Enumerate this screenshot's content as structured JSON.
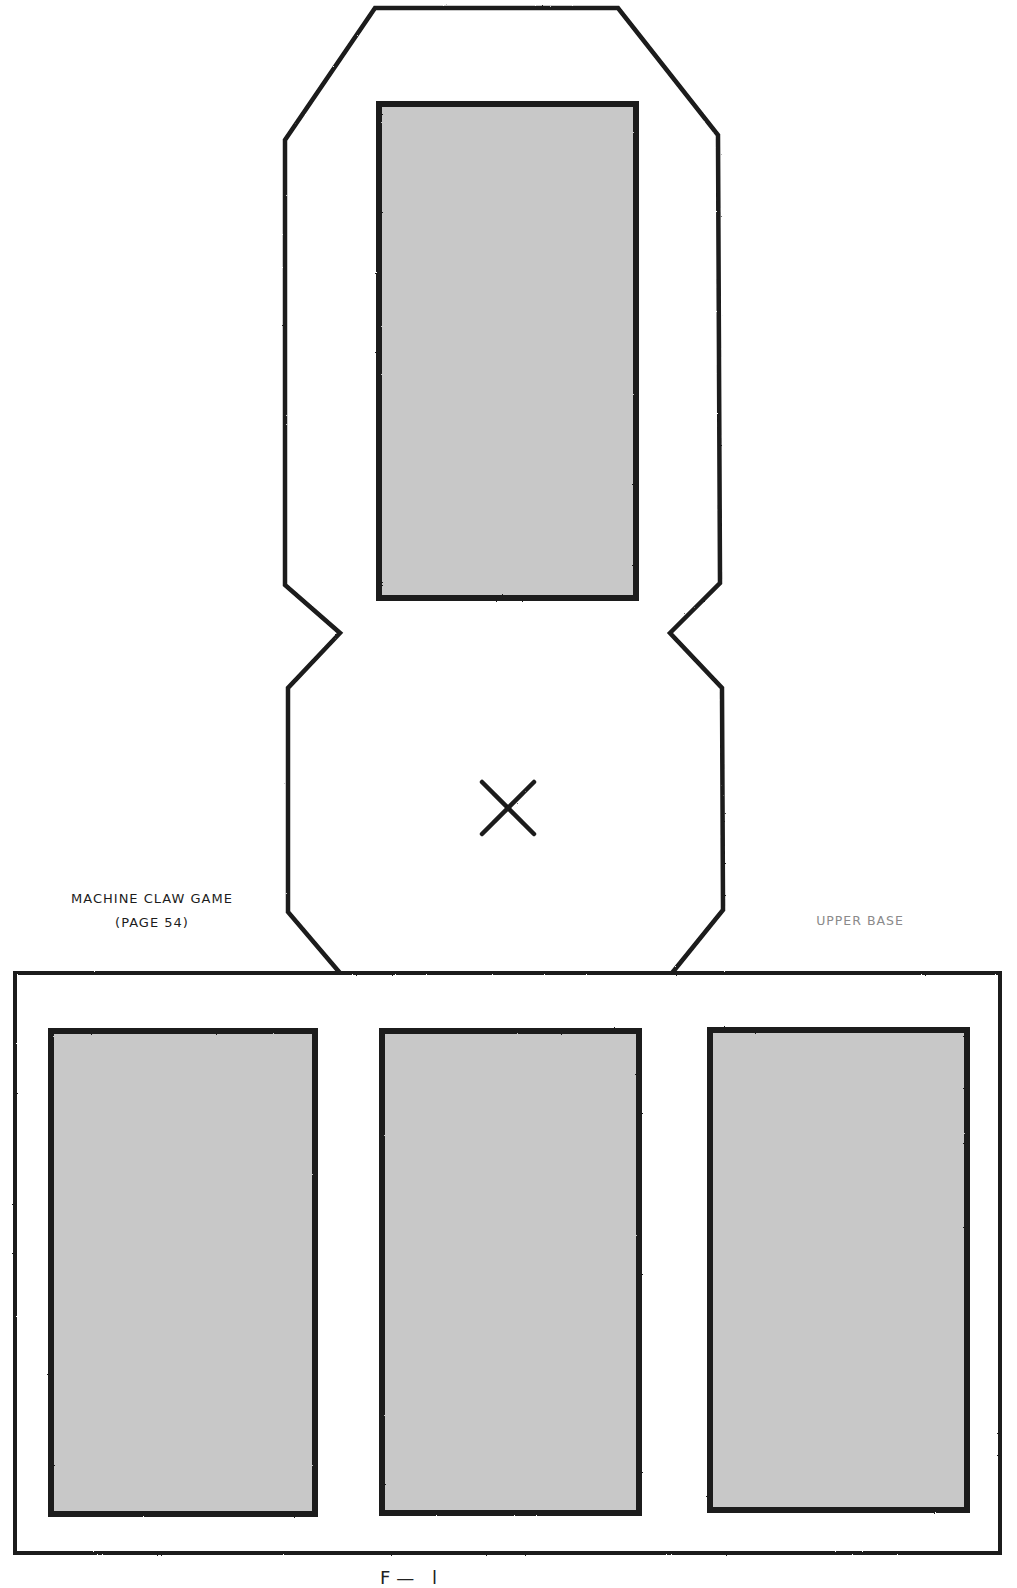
{
  "document": {
    "kind": "papercraft-cutout-template",
    "labels": {
      "project_title": "Machine Claw Game",
      "project_page": "(page 54)",
      "piece_name": "Upper Base",
      "footer_partial": "F— l"
    }
  },
  "colors": {
    "cut_line": "#1a1a1a",
    "fold_line": "#a6a6a6",
    "window_fill": "#c8c8c8",
    "paper": "#ffffff",
    "title_text": "#1c1c1c",
    "piece_label_text": "#8a8a8a"
  },
  "geometry": {
    "outline_path": "M 340 973 L 288 912 L 288 688 L 340 633 L 285 585 L 285 140 L 375 8 L 618 8 L 718 135 L 720 583 L 670 633 L 722 688 L 723 910 L 672 973",
    "base_rect": {
      "x": 15,
      "y": 973,
      "w": 985,
      "h": 580
    },
    "fold_lines": [
      {
        "x1": 341,
        "y1": 64,
        "x2": 341,
        "y2": 1545
      },
      {
        "x1": 672,
        "y1": 64,
        "x2": 672,
        "y2": 1545
      },
      {
        "x1": 341,
        "y1": 64,
        "x2": 672,
        "y2": 64
      },
      {
        "x1": 341,
        "y1": 633,
        "x2": 672,
        "y2": 633
      },
      {
        "x1": 341,
        "y1": 973,
        "x2": 672,
        "y2": 973
      }
    ],
    "windows": [
      {
        "name": "top-panel-window",
        "x": 379,
        "y": 104,
        "w": 257,
        "h": 494
      },
      {
        "name": "base-left-window",
        "x": 51,
        "y": 1031,
        "w": 264,
        "h": 483
      },
      {
        "name": "base-middle-window",
        "x": 382,
        "y": 1031,
        "w": 257,
        "h": 482
      },
      {
        "name": "base-right-window",
        "x": 710,
        "y": 1030,
        "w": 257,
        "h": 480
      }
    ],
    "center_mark": {
      "cx": 508,
      "cy": 808,
      "size": 26
    }
  }
}
